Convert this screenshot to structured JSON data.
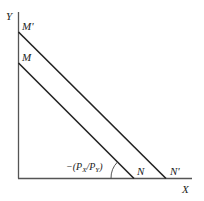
{
  "diagram": {
    "type": "budget-line-shift",
    "axes": {
      "x_label": "X",
      "y_label": "Y"
    },
    "lines": [
      {
        "name": "original budget line",
        "start_label": "M",
        "end_label": "N"
      },
      {
        "name": "shifted budget line",
        "start_label": "M'",
        "end_label": "N'"
      }
    ],
    "slope_annotation": "−(P",
    "slope_sub_x": "X",
    "slope_mid": "/P",
    "slope_sub_y": "Y",
    "slope_close": ")"
  }
}
